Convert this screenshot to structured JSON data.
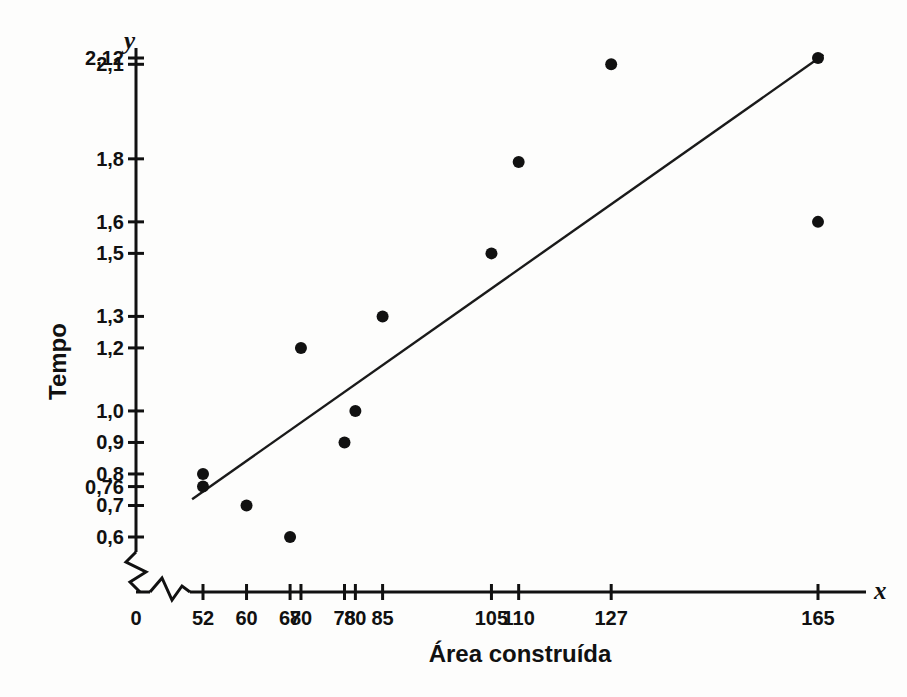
{
  "chart_data": {
    "type": "scatter",
    "title": "",
    "xlabel": "Área construída",
    "ylabel": "Tempo",
    "x_axis_symbol": "x",
    "y_axis_symbol": "y",
    "grid": false,
    "legend": "none",
    "axis_break_x": true,
    "axis_break_y": true,
    "xlim": [
      0,
      175
    ],
    "ylim": [
      0.55,
      2.18
    ],
    "x_tick_labels": [
      "0",
      "52",
      "60",
      "68",
      "70",
      "78",
      "80",
      "85",
      "105",
      "110",
      "127",
      "165"
    ],
    "x_tick_values": [
      0,
      52,
      60,
      68,
      70,
      78,
      80,
      85,
      105,
      110,
      127,
      165
    ],
    "y_tick_labels": [
      "0,6",
      "0,7",
      "0,76",
      "0,8",
      "0,9",
      "1,0",
      "1,2",
      "1,3",
      "1,5",
      "1,6",
      "1,8",
      "2,1",
      "2,12"
    ],
    "y_tick_values": [
      0.6,
      0.7,
      0.76,
      0.8,
      0.9,
      1.0,
      1.2,
      1.3,
      1.5,
      1.6,
      1.8,
      2.1,
      2.12
    ],
    "points": [
      {
        "x": 52,
        "y": 0.8
      },
      {
        "x": 52,
        "y": 0.76
      },
      {
        "x": 60,
        "y": 0.7
      },
      {
        "x": 68,
        "y": 0.6
      },
      {
        "x": 70,
        "y": 1.2
      },
      {
        "x": 78,
        "y": 0.9
      },
      {
        "x": 80,
        "y": 1.0
      },
      {
        "x": 85,
        "y": 1.3
      },
      {
        "x": 105,
        "y": 1.5
      },
      {
        "x": 110,
        "y": 1.79
      },
      {
        "x": 127,
        "y": 2.1
      },
      {
        "x": 165,
        "y": 2.12
      },
      {
        "x": 165,
        "y": 1.6
      }
    ],
    "trend_line": {
      "type": "linear-fit",
      "x_start": 50,
      "y_start": 0.72,
      "x_end": 166,
      "y_end": 2.13
    },
    "marker_color": "#111111",
    "line_color": "#1a1a1a",
    "axis_color": "#111111",
    "background_color": "#fdfdfc"
  },
  "axes": {
    "y_symbol": "y",
    "x_symbol": "x",
    "y_title": "Tempo",
    "x_title": "Área construída"
  }
}
